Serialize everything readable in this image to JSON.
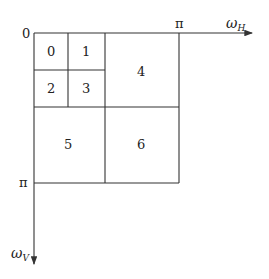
{
  "diagram": {
    "type": "frequency-subband-decomposition",
    "origin_label": "0",
    "horizontal_axis": {
      "label": "ω",
      "subscript": "H",
      "pi_label": "π"
    },
    "vertical_axis": {
      "label": "ω",
      "subscript": "V",
      "pi_label": "π"
    },
    "subbands": [
      {
        "id": "0",
        "label": "0"
      },
      {
        "id": "1",
        "label": "1"
      },
      {
        "id": "2",
        "label": "2"
      },
      {
        "id": "3",
        "label": "3"
      },
      {
        "id": "4",
        "label": "4"
      },
      {
        "id": "5",
        "label": "5"
      },
      {
        "id": "6",
        "label": "6"
      }
    ],
    "colors": {
      "line": "#333333",
      "text": "#222222"
    }
  }
}
